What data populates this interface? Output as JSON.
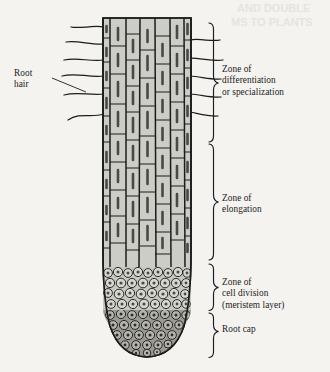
{
  "figure": {
    "background_color": "#f4f3f0",
    "ink_color": "#1c1c1c",
    "cell_fill_color": "#cdcdc8",
    "nucleus_color": "#6e6e68",
    "root_cap_color": "#8e8e88"
  },
  "labels": {
    "root_hair": "Root\nhair",
    "zone_differentiation": "Zone of\ndifferentiation\nor specialization",
    "zone_elongation": "Zone of\nelongation",
    "zone_cell_division": "Zone of\ncell division\n(meristem layer)",
    "root_cap": "Root cap"
  },
  "zones": [
    {
      "name": "zone-of-differentiation",
      "label": "Zone of differentiation or specialization",
      "brace_top": 22,
      "brace_bottom": 142
    },
    {
      "name": "zone-of-elongation",
      "label": "Zone of elongation",
      "brace_top": 142,
      "brace_bottom": 262
    },
    {
      "name": "zone-of-cell-division",
      "label": "Zone of cell division (meristem layer)",
      "brace_top": 262,
      "brace_bottom": 310
    },
    {
      "name": "root-cap",
      "label": "Root cap",
      "brace_top": 310,
      "brace_bottom": 360
    }
  ],
  "root_hairs": {
    "left_count": 6,
    "right_count": 5
  },
  "ghost_text": {
    "line1": "AND DOUBLE",
    "line2": "MS TO PLANTS"
  }
}
